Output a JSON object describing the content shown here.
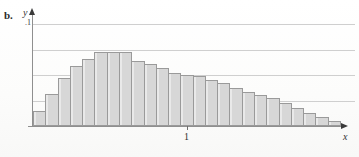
{
  "figure": {
    "panel_label": "b.",
    "background_color": "#fdfdfc"
  },
  "chart_data": {
    "type": "bar",
    "title": "",
    "subtitle": "",
    "xlabel": "x",
    "ylabel": "y",
    "legend": [],
    "legend_position": "none",
    "grid": true,
    "gridlines_y": [
      0.1,
      0.075,
      0.05,
      0.025
    ],
    "axis_arrows": {
      "x": true,
      "y": true
    },
    "xlim": [
      0,
      2.0
    ],
    "ylim": [
      0,
      0.1
    ],
    "x_tick_labels": [
      "1"
    ],
    "x_tick_values": [
      1
    ],
    "y_tick_labels": [
      ".1"
    ],
    "y_tick_values": [
      0.1
    ],
    "bar_count": 25,
    "bar_fill_color": "#d7d7d7",
    "bar_edge_color": "#9a9a9a",
    "categories": [
      "0.00",
      "0.08",
      "0.16",
      "0.24",
      "0.32",
      "0.40",
      "0.48",
      "0.56",
      "0.64",
      "0.72",
      "0.80",
      "0.88",
      "0.96",
      "1.04",
      "1.12",
      "1.20",
      "1.28",
      "1.36",
      "1.44",
      "1.52",
      "1.60",
      "1.68",
      "1.76",
      "1.84",
      "1.92"
    ],
    "values": [
      0.0145,
      0.0315,
      0.047,
      0.0585,
      0.0655,
      0.073,
      0.073,
      0.073,
      0.064,
      0.0605,
      0.057,
      0.052,
      0.05,
      0.049,
      0.0455,
      0.042,
      0.0375,
      0.033,
      0.0305,
      0.027,
      0.023,
      0.018,
      0.013,
      0.009,
      0.005
    ],
    "annotations": []
  }
}
